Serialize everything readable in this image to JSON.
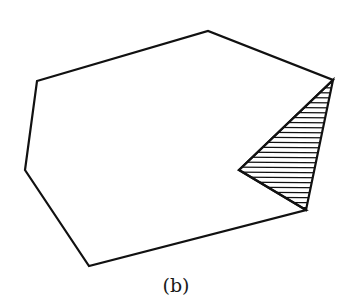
{
  "figure": {
    "caption": "(b)",
    "stroke_color": "#111111",
    "background": "#ffffff",
    "polygon": {
      "description": "Non-convex heptagon with a notch (reflex vertex) on the right side",
      "vertices": [
        [
          37,
          81
        ],
        [
          208,
          31
        ],
        [
          333,
          80
        ],
        [
          239,
          170
        ],
        [
          306,
          210
        ],
        [
          89,
          266
        ],
        [
          25,
          170
        ]
      ]
    },
    "hatched_region": {
      "description": "Triangle filling the notch between the two right vertices and the reflex vertex",
      "vertices": [
        [
          333,
          80
        ],
        [
          239,
          170
        ],
        [
          306,
          210
        ]
      ],
      "hatch": "horizontal",
      "hatch_spacing_px": 5
    }
  }
}
